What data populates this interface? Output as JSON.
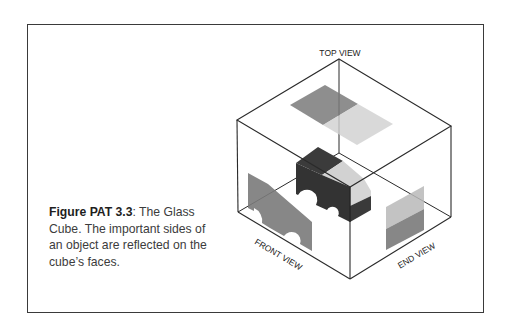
{
  "figure": {
    "label": "Figure PAT 3.3",
    "caption_separator": ":",
    "caption_text": " The Glass Cube. The important sides of an object are reflected on the cube’s faces."
  },
  "diagram": {
    "title": "The Glass Cube",
    "labels": {
      "top": "TOP VIEW",
      "front": "FRONT VIEW",
      "end": "END VIEW"
    },
    "colors": {
      "frame": "#3a3a3a",
      "edges": "#2a2a2a",
      "projection_dark": "#7a7a7a",
      "projection_light": "#cfcfcf",
      "object_dark": "#3b3b3b",
      "object_light": "#d2d2d2"
    }
  }
}
